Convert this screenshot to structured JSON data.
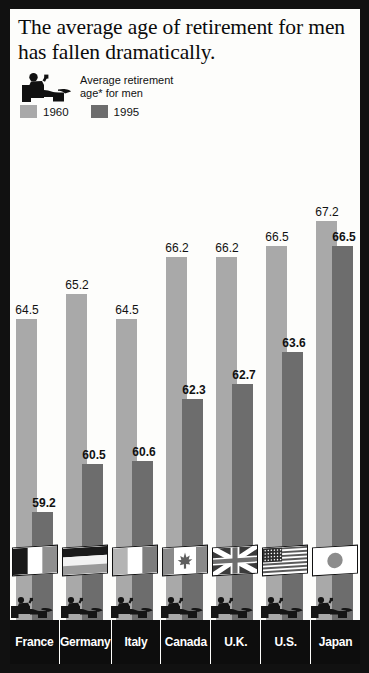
{
  "title": "The average age of retirement for men has fallen dramatically.",
  "legend": {
    "icon_name": "reclining-person-in-armchair-icon",
    "caption_line1": "Average retirement",
    "caption_line2": "age* for men",
    "series": [
      {
        "label": "1960",
        "color": "#a9a9a9"
      },
      {
        "label": "1995",
        "color": "#6d6d6d"
      }
    ]
  },
  "chart_data": {
    "type": "bar",
    "title": "The average age of retirement for men has fallen dramatically.",
    "xlabel": "",
    "ylabel": "Average retirement age* for men",
    "ylim": [
      55,
      68
    ],
    "grid": false,
    "legend_position": "top-left",
    "categories": [
      "France",
      "Germany",
      "Italy",
      "Canada",
      "U.K.",
      "U.S.",
      "Japan"
    ],
    "series": [
      {
        "name": "1960",
        "color": "#a9a9a9",
        "values": [
          64.5,
          65.2,
          64.5,
          66.2,
          66.2,
          66.5,
          67.2
        ]
      },
      {
        "name": "1995",
        "color": "#6d6d6d",
        "values": [
          59.2,
          60.5,
          60.6,
          62.3,
          62.7,
          63.6,
          66.5
        ]
      }
    ],
    "value_labels": {
      "1960": [
        "64.5",
        "65.2",
        "64.5",
        "66.2",
        "66.2",
        "66.5",
        "67.2"
      ],
      "1995": [
        "59.2",
        "60.5",
        "60.6",
        "62.3",
        "62.7",
        "63.6",
        "66.5"
      ]
    },
    "flags": [
      "france-flag",
      "germany-flag",
      "italy-flag",
      "canada-flag",
      "uk-flag",
      "us-flag",
      "japan-flag"
    ]
  },
  "colors": {
    "series_1960": "#a9a9a9",
    "series_1995": "#6d6d6d",
    "frame": "#111111",
    "background": "#fdfdfb",
    "label_bar": "#0d0d0d"
  }
}
